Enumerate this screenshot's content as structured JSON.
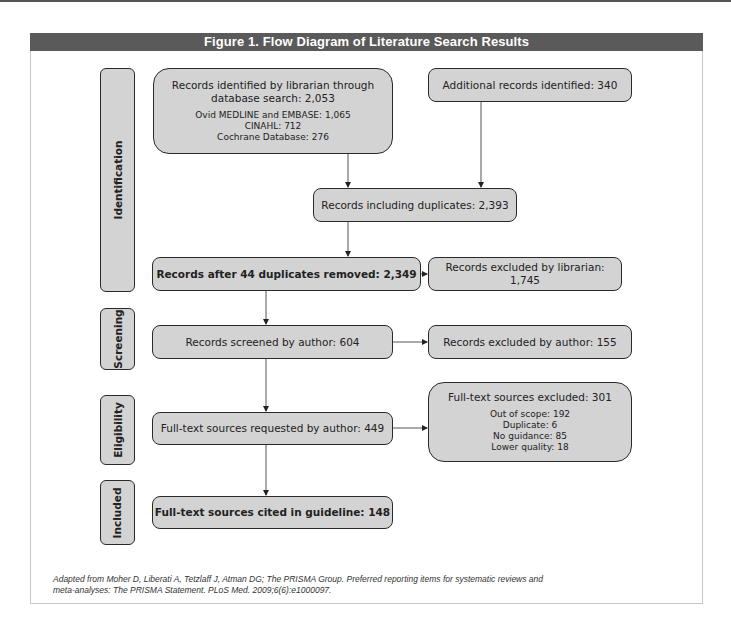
{
  "figure": {
    "title": "Figure 1.  Flow Diagram of Literature Search Results",
    "caption_line1": "Adapted from Moher D, Liberati A, Tetzlaff J, Atman DG; The PRISMA Group. Preferred reporting items for systematic reviews and",
    "caption_line2": "meta-analyses: The PRISMA Statement. PLoS Med. 2009;6(6):e1000097."
  },
  "stages": [
    {
      "label": "Identification"
    },
    {
      "label": "Screening"
    },
    {
      "label": "Eligibility"
    },
    {
      "label": "Included"
    }
  ],
  "boxes": {
    "librarian_records": {
      "line1": "Records identified by librarian through",
      "line2": "database search: 2,053",
      "details": [
        "Ovid MEDLINE and EMBASE: 1,065",
        "CINAHL: 712",
        "Cochrane Database: 276"
      ]
    },
    "additional_records": {
      "text": "Additional records identified: 340"
    },
    "including_duplicates": {
      "text": "Records including duplicates: 2,393"
    },
    "after_duplicates_removed": {
      "text": "Records after 44 duplicates removed: 2,349"
    },
    "excluded_by_librarian": {
      "text": "Records excluded by librarian: 1,745"
    },
    "screened_by_author": {
      "text": "Records screened by author: 604"
    },
    "excluded_by_author": {
      "text": "Records excluded by author: 155"
    },
    "fulltext_requested": {
      "text": "Full-text sources requested by author: 449"
    },
    "fulltext_excluded": {
      "title": "Full-text sources excluded: 301",
      "details": [
        "Out of scope: 192",
        "Duplicate: 6",
        "No guidance: 85",
        "Lower quality: 18"
      ]
    },
    "cited_in_guideline": {
      "text": "Full-text sources cited in guideline: 148"
    }
  },
  "colors": {
    "header_bg": "#5a5a5a",
    "box_fill": "#d3d3d3",
    "box_border": "#2a2a2a",
    "frame_border": "#c8c8c8"
  }
}
